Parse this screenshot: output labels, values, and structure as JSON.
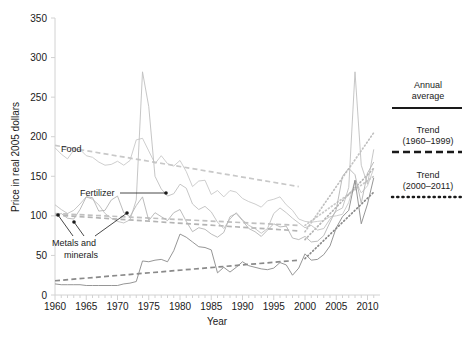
{
  "figure": {
    "title_fragment": "",
    "background": "#ffffff",
    "axis_color": "#cfcfcf",
    "text_color": "#1a1a1a"
  },
  "axes": {
    "xlabel": "Year",
    "ylabel": "Price in real 2005 dollars",
    "xticks": [
      "1960",
      "1965",
      "1970",
      "1975",
      "1980",
      "1985",
      "1990",
      "1995",
      "2000",
      "2005",
      "2010"
    ],
    "yticks": [
      "0",
      "50",
      "100",
      "150",
      "200",
      "250",
      "300",
      "350"
    ],
    "xlim": [
      1960,
      2012
    ],
    "ylim": [
      0,
      350
    ],
    "grid": false
  },
  "legend": {
    "position": "right",
    "items": [
      {
        "label_line1": "Annual",
        "label_line2": "average",
        "style": "solid",
        "color": "#1a1a1a"
      },
      {
        "label_line1": "Trend",
        "label_line2": "(1960–1999)",
        "style": "dashed",
        "color": "#1a1a1a"
      },
      {
        "label_line1": "Trend",
        "label_line2": "(2000–2011)",
        "style": "dotted",
        "color": "#1a1a1a"
      }
    ]
  },
  "annotations": [
    {
      "name": "food",
      "text": "Food",
      "x": 61,
      "y": 152,
      "anchor": "start",
      "leader": null
    },
    {
      "name": "fertilizer",
      "text": "Fertilizer",
      "x": 80,
      "y": 196,
      "anchor": "start",
      "leader": {
        "x1": 120,
        "y1": 193,
        "x2": 166,
        "y2": 193,
        "dot": [
          166,
          193
        ]
      }
    },
    {
      "name": "metals-and-minerals",
      "text": "Metals and",
      "text2": "minerals",
      "x": 52,
      "y": 243,
      "anchor": "start",
      "leaders": [
        {
          "x1": 73,
          "y1": 236,
          "x2": 58,
          "y2": 215,
          "dot": [
            58,
            215
          ]
        },
        {
          "x1": 84,
          "y1": 236,
          "x2": 74,
          "y2": 222,
          "dot": [
            74,
            222
          ]
        },
        {
          "x1": 95,
          "y1": 236,
          "x2": 127,
          "y2": 213,
          "dot": [
            127,
            213
          ]
        }
      ]
    }
  ],
  "chart_data": {
    "type": "line",
    "xlabel": "Year",
    "ylabel": "Price in real 2005 dollars",
    "xlim": [
      1960,
      2012
    ],
    "ylim": [
      0,
      350
    ],
    "grid": false,
    "legend_position": "right",
    "x": [
      1960,
      1961,
      1962,
      1963,
      1964,
      1965,
      1966,
      1967,
      1968,
      1969,
      1970,
      1971,
      1972,
      1973,
      1974,
      1975,
      1976,
      1977,
      1978,
      1979,
      1980,
      1981,
      1982,
      1983,
      1984,
      1985,
      1986,
      1987,
      1988,
      1989,
      1990,
      1991,
      1992,
      1993,
      1994,
      1995,
      1996,
      1997,
      1998,
      1999,
      2000,
      2001,
      2002,
      2003,
      2004,
      2005,
      2006,
      2007,
      2008,
      2009,
      2010,
      2011
    ],
    "series": [
      {
        "name": "Food",
        "color": "#c8c8c8",
        "style": "solid",
        "values": [
          186,
          178,
          172,
          183,
          184,
          176,
          174,
          168,
          164,
          165,
          169,
          164,
          170,
          196,
          198,
          182,
          166,
          176,
          166,
          163,
          170,
          156,
          137,
          144,
          145,
          127,
          132,
          124,
          132,
          130,
          122,
          118,
          115,
          111,
          119,
          121,
          124,
          114,
          107,
          96,
          93,
          92,
          93,
          94,
          99,
          100,
          102,
          117,
          145,
          129,
          138,
          160
        ]
      },
      {
        "name": "Fertilizer",
        "color": "#c0c0c0",
        "style": "solid",
        "values": [
          114,
          108,
          103,
          107,
          115,
          124,
          121,
          114,
          103,
          97,
          93,
          91,
          95,
          120,
          282,
          238,
          150,
          134,
          125,
          128,
          140,
          135,
          115,
          108,
          112,
          105,
          92,
          84,
          96,
          104,
          95,
          88,
          84,
          78,
          84,
          103,
          110,
          104,
          97,
          91,
          85,
          88,
          82,
          84,
          96,
          106,
          110,
          136,
          282,
          164,
          140,
          184
        ]
      },
      {
        "name": "Metals and minerals",
        "color": "#b4b4b4",
        "style": "solid",
        "values": [
          100,
          103,
          97,
          96,
          108,
          124,
          123,
          106,
          107,
          120,
          125,
          104,
          99,
          113,
          124,
          94,
          104,
          99,
          94,
          104,
          108,
          93,
          80,
          85,
          83,
          77,
          73,
          79,
          99,
          103,
          94,
          84,
          80,
          74,
          82,
          90,
          86,
          87,
          72,
          70,
          74,
          67,
          68,
          75,
          92,
          108,
          150,
          160,
          152,
          116,
          154,
          168
        ]
      },
      {
        "name": "Energy",
        "color": "#8a8a8a",
        "style": "solid",
        "values": [
          14,
          13,
          13,
          13,
          13,
          12,
          12,
          12,
          12,
          12,
          12,
          14,
          15,
          17,
          43,
          42,
          44,
          45,
          42,
          56,
          77,
          73,
          67,
          61,
          60,
          57,
          28,
          35,
          29,
          35,
          42,
          37,
          35,
          33,
          32,
          34,
          41,
          38,
          25,
          34,
          52,
          44,
          45,
          51,
          62,
          85,
          99,
          107,
          145,
          90,
          115,
          148
        ]
      }
    ],
    "trend_lines": [
      {
        "name": "Food trend 1960-1999",
        "style": "dashed",
        "color": "#c8c8c8",
        "x": [
          1960,
          1999
        ],
        "values": [
          189,
          137
        ]
      },
      {
        "name": "Fertilizer trend 1960-1999",
        "style": "dashed",
        "color": "#c0c0c0",
        "x": [
          1960,
          1999
        ],
        "values": [
          103,
          88
        ]
      },
      {
        "name": "Metals trend 1960-1999",
        "style": "dashed",
        "color": "#b4b4b4",
        "x": [
          1960,
          1999
        ],
        "values": [
          101,
          81
        ]
      },
      {
        "name": "Energy trend 1960-1999",
        "style": "dashed",
        "color": "#8a8a8a",
        "x": [
          1960,
          1999
        ],
        "values": [
          18,
          44
        ]
      },
      {
        "name": "Food trend 2000-2011",
        "style": "dotted",
        "color": "#c8c8c8",
        "x": [
          2000,
          2011
        ],
        "values": [
          88,
          150
        ]
      },
      {
        "name": "Fertilizer trend 2000-2011",
        "style": "dotted",
        "color": "#c0c0c0",
        "x": [
          2000,
          2011
        ],
        "values": [
          80,
          205
        ]
      },
      {
        "name": "Metals trend 2000-2011",
        "style": "dotted",
        "color": "#b4b4b4",
        "x": [
          2000,
          2011
        ],
        "values": [
          70,
          160
        ]
      },
      {
        "name": "Energy trend 2000-2011",
        "style": "dotted",
        "color": "#8a8a8a",
        "x": [
          2000,
          2011
        ],
        "values": [
          46,
          130
        ]
      }
    ],
    "annotations": [
      "Food",
      "Fertilizer",
      "Metals and minerals"
    ]
  }
}
